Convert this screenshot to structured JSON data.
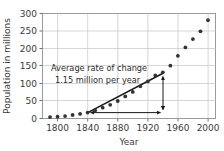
{
  "chart_data": {
    "type": "scatter",
    "title": "",
    "xlabel": "Year",
    "ylabel": "Population in millions",
    "xlim": [
      1780,
      2010
    ],
    "ylim": [
      0,
      300
    ],
    "grid": true,
    "legend": null,
    "x_ticks": [
      1800,
      1840,
      1880,
      1920,
      1960,
      2000
    ],
    "y_ticks": [
      0,
      50,
      100,
      150,
      200,
      250,
      300
    ],
    "x": [
      1790,
      1800,
      1810,
      1820,
      1830,
      1840,
      1850,
      1860,
      1870,
      1880,
      1890,
      1900,
      1910,
      1920,
      1930,
      1940,
      1950,
      1960,
      1970,
      1980,
      1990,
      2000
    ],
    "values": [
      4,
      5,
      7,
      10,
      13,
      17,
      23,
      31,
      39,
      50,
      63,
      76,
      92,
      106,
      123,
      132,
      151,
      179,
      203,
      227,
      249,
      281
    ],
    "annotations": [
      {
        "name": "average-rate-of-change",
        "line1": "Average rate of change",
        "line2": "1.15 million per year",
        "secant_from": [
          1840,
          17
        ],
        "secant_to": [
          1940,
          132
        ],
        "rate": 1.15,
        "units": "million per year"
      }
    ]
  },
  "axes": {
    "y_label": "Population in millions",
    "x_label": "Year",
    "y_tick_labels": [
      "0",
      "50",
      "100",
      "150",
      "200",
      "250",
      "300"
    ],
    "x_tick_labels": [
      "1800",
      "1840",
      "1880",
      "1920",
      "1960",
      "2000"
    ]
  },
  "annotation": {
    "line1": "Average rate of change",
    "line2": "1.15 million per year"
  },
  "colors": {
    "background": "#ffffff",
    "frame": "#999999",
    "grid": "#c8c8c8",
    "marker": "#333333",
    "secant": "#1a1a1a",
    "arrow": "#1a1a1a",
    "text": "#3a3a3a"
  }
}
